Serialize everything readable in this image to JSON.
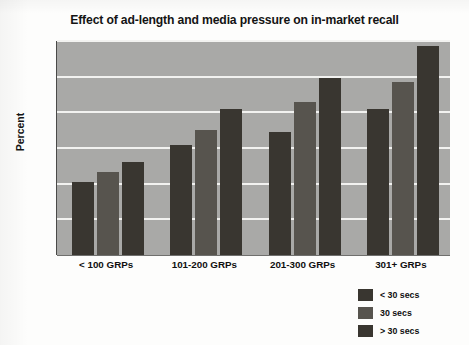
{
  "chart_data": {
    "type": "bar",
    "title": "Effect of ad-length and media pressure on in-market recall",
    "xlabel": "",
    "ylabel": "Percent",
    "ylim": [
      0,
      30
    ],
    "yticks": [
      0,
      5,
      10,
      15,
      20,
      25,
      30
    ],
    "ytick_labels": [
      "0",
      "5",
      "10",
      "15",
      "20",
      "25",
      "30"
    ],
    "grid": true,
    "legend_position": "bottom-right",
    "categories": [
      "< 100 GRPs",
      "101-200 GRPs",
      "201-300 GRPs",
      "301+ GRPs"
    ],
    "series": [
      {
        "name": "< 30 secs",
        "color": "#393630",
        "values": [
          10.2,
          15.4,
          17.3,
          20.5
        ]
      },
      {
        "name": "30 secs",
        "color": "#57544e",
        "values": [
          11.6,
          17.5,
          21.5,
          24.3
        ]
      },
      {
        "name": "> 30 secs",
        "color": "#393630",
        "values": [
          13.0,
          20.5,
          24.8,
          29.3
        ]
      }
    ]
  },
  "colors": {
    "plot_background": "#a9a9a7",
    "gridline": "#f2f2f0",
    "page_background": "#fdfdfc",
    "text": "#101010"
  }
}
